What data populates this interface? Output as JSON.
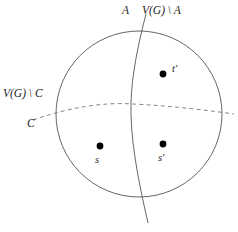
{
  "figure": {
    "title": "",
    "colors": {
      "stroke": "#555555",
      "dashed_stroke": "#777777",
      "point_fill": "#000000",
      "background": "#ffffff",
      "text": "#222222"
    },
    "shapes": {
      "circle": {
        "cx": 139,
        "cy": 114,
        "r": 83
      },
      "vertical_curve": {
        "x_top": 146,
        "y_top": 14,
        "x_bottom": 148,
        "y_bottom": 223,
        "x_mid": 131,
        "y_mid": 115
      },
      "dashed_curve": {
        "x_start": 33,
        "y_start": 120,
        "x_end": 234,
        "y_end": 114,
        "x_mid": 133,
        "y_mid": 104
      }
    },
    "labels": {
      "A": "A",
      "VG_minus_A": "V(G) \\ A",
      "VG_minus_C": "V(G) \\ C",
      "C": "C",
      "t_prime": "t′",
      "s": "s",
      "s_prime": "s′"
    },
    "points": [
      {
        "name": "t-prime",
        "cx": 163,
        "cy": 74,
        "r": 3.4,
        "label": "t′"
      },
      {
        "name": "s",
        "cx": 100,
        "cy": 146,
        "r": 3.4,
        "label": "s"
      },
      {
        "name": "s-prime",
        "cx": 163,
        "cy": 144,
        "r": 3.4,
        "label": "s′"
      }
    ]
  }
}
